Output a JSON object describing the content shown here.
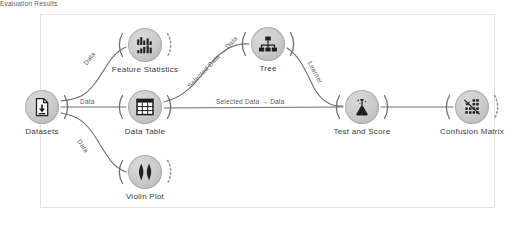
{
  "app": {
    "title": "Orange Workflow Canvas",
    "canvas_background": "#ffffff",
    "frame_border_color": "#e2e2e2",
    "node_fill": "#cccccc",
    "node_stroke": "#969696",
    "link_color": "#6e6e6e",
    "label_color": "#5a5a5a",
    "caption_color": "#3c3c3c"
  },
  "nodes": [
    {
      "id": "datasets",
      "label": "Datasets",
      "icon": "document-download-icon",
      "x": 42,
      "y": 107,
      "has_input": false,
      "has_output": true,
      "output_dashed": false
    },
    {
      "id": "feature-statistics",
      "label": "Feature Statistics",
      "icon": "bar-chart-icon",
      "x": 145,
      "y": 45,
      "has_input": true,
      "has_output": true,
      "output_dashed": true
    },
    {
      "id": "data-table",
      "label": "Data Table",
      "icon": "table-grid-icon",
      "x": 145,
      "y": 107,
      "has_input": true,
      "has_output": true,
      "output_dashed": false
    },
    {
      "id": "violin-plot",
      "label": "Violin Plot",
      "icon": "violin-icon",
      "x": 145,
      "y": 172,
      "has_input": true,
      "has_output": true,
      "output_dashed": true
    },
    {
      "id": "tree",
      "label": "Tree",
      "icon": "tree-hierarchy-icon",
      "x": 268,
      "y": 44,
      "has_input": true,
      "has_output": true,
      "output_dashed": false
    },
    {
      "id": "test-and-score",
      "label": "Test and Score",
      "icon": "flask-icon",
      "x": 362,
      "y": 107,
      "has_input": true,
      "has_output": true,
      "output_dashed": false
    },
    {
      "id": "confusion-matrix",
      "label": "Confusion Matrix",
      "icon": "confusion-grid-icon",
      "x": 472,
      "y": 107,
      "has_input": true,
      "has_output": true,
      "output_dashed": true
    }
  ],
  "links": [
    {
      "id": "datasets-to-feature-statistics",
      "from": "datasets",
      "to": "feature-statistics",
      "label": "Data"
    },
    {
      "id": "datasets-to-data-table",
      "from": "datasets",
      "to": "data-table",
      "label": "Data"
    },
    {
      "id": "datasets-to-violin-plot",
      "from": "datasets",
      "to": "violin-plot",
      "label": "Data"
    },
    {
      "id": "data-table-to-tree",
      "from": "data-table",
      "to": "tree",
      "label": "Selected Data → Data"
    },
    {
      "id": "data-table-to-test-and-score",
      "from": "data-table",
      "to": "test-and-score",
      "label": "Selected Data → Data"
    },
    {
      "id": "tree-to-test-and-score",
      "from": "tree",
      "to": "test-and-score",
      "label": "Learner"
    },
    {
      "id": "test-and-score-to-confusion",
      "from": "test-and-score",
      "to": "confusion-matrix",
      "label": "Evaluation Results"
    }
  ]
}
